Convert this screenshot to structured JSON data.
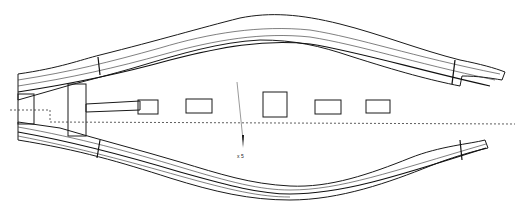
{
  "diagram": {
    "type": "finite-element mesh drawing",
    "stroke_color": "#1a1a1a",
    "background": "#ffffff",
    "components": [
      {
        "id": "upper-beam",
        "label": "upper curved beam"
      },
      {
        "id": "lower-beam",
        "label": "lower curved beam"
      },
      {
        "id": "left-clamp",
        "label": "left clamp block"
      },
      {
        "id": "inner-clamp",
        "label": "inner clamp block"
      },
      {
        "id": "center-rod",
        "label": "central tapered rod"
      },
      {
        "id": "block-1",
        "label": "mesh block 1"
      },
      {
        "id": "block-2",
        "label": "mesh block 2"
      },
      {
        "id": "block-3",
        "label": "mesh block 3"
      },
      {
        "id": "block-4",
        "label": "mesh block 4"
      }
    ],
    "axis_label": "x 5"
  }
}
